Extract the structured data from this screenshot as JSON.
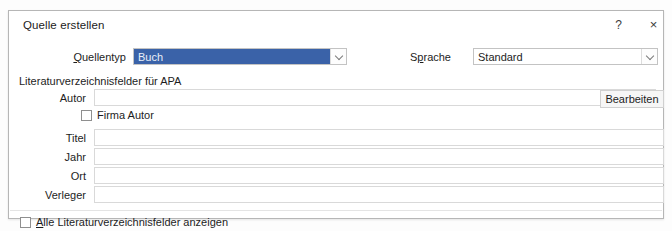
{
  "dialog": {
    "title": "Quelle erstellen",
    "help_label": "?",
    "close_label": "×",
    "section_caption": "Literaturverzeichnisfelder für APA"
  },
  "fields": {
    "quellentyp": {
      "label_pre": "",
      "label_accel": "Q",
      "label_post": "uellentyp",
      "value": "Buch",
      "selected": true
    },
    "sprache": {
      "label_pre": "S",
      "label_accel": "p",
      "label_post": "rache",
      "value": "Standard",
      "selected": false
    },
    "autor": {
      "label": "Autor",
      "value": ""
    },
    "titel": {
      "label": "Titel",
      "value": ""
    },
    "jahr": {
      "label": "Jahr",
      "value": ""
    },
    "ort": {
      "label": "Ort",
      "value": ""
    },
    "verleger": {
      "label": "Verleger",
      "value": ""
    }
  },
  "checkboxes": {
    "firma_autor": {
      "label": "Firma Autor",
      "checked": false
    },
    "alle_felder": {
      "label_pre": "",
      "label_accel": "A",
      "label_post": "lle Literaturverzeichnisfelder anzeigen",
      "checked": false
    }
  },
  "buttons": {
    "bearbeiten": "Bearbeiten"
  },
  "colors": {
    "selection_blue": "#3a62a8",
    "dialog_border": "#b6b6b6",
    "input_border": "#d9d9d9",
    "text": "#1d1d1d"
  }
}
